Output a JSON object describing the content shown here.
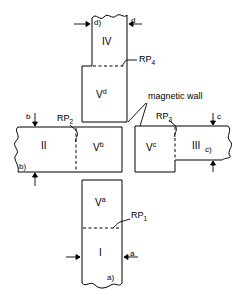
{
  "figure": {
    "annotation": "magnetic wall",
    "line_color": "#000000",
    "background": "#ffffff"
  },
  "regions": [
    {
      "id": "I",
      "label": "I"
    },
    {
      "id": "II",
      "label": "II"
    },
    {
      "id": "III",
      "label": "III"
    },
    {
      "id": "IV",
      "label": "IV"
    }
  ],
  "volumes": [
    {
      "id": "Va",
      "base": "V",
      "sup": "a"
    },
    {
      "id": "Vb",
      "base": "V",
      "sup": "b"
    },
    {
      "id": "Vc",
      "base": "V",
      "sup": "c"
    },
    {
      "id": "Vd",
      "base": "V",
      "sup": "d"
    }
  ],
  "reference_points": [
    {
      "id": "RP1",
      "base": "RP",
      "sub": "1"
    },
    {
      "id": "RP2",
      "base": "RP",
      "sub": "2"
    },
    {
      "id": "RP3",
      "base": "RP",
      "sub": "3"
    },
    {
      "id": "RP4",
      "base": "RP",
      "sub": "4"
    }
  ],
  "dimensions": [
    {
      "id": "a",
      "label": "a"
    },
    {
      "id": "a_paren",
      "label": "a)"
    },
    {
      "id": "b",
      "label": "b"
    },
    {
      "id": "b_paren",
      "label": "b)"
    },
    {
      "id": "c",
      "label": "c"
    },
    {
      "id": "c_paren",
      "label": "c)"
    },
    {
      "id": "d",
      "label": "d"
    },
    {
      "id": "d_paren",
      "label": "d)"
    }
  ]
}
